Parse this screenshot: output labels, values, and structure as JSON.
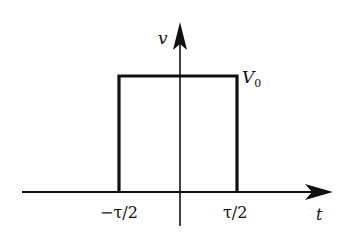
{
  "diagram": {
    "type": "rectangular-pulse",
    "axes": {
      "vertical_label": "v",
      "horizontal_label": "t"
    },
    "pulse": {
      "amplitude_label": "V",
      "amplitude_subscript": "0",
      "left_edge_label": "−τ/2",
      "right_edge_label": "τ/2"
    },
    "colors": {
      "stroke": "#111111",
      "background": "#ffffff"
    }
  }
}
